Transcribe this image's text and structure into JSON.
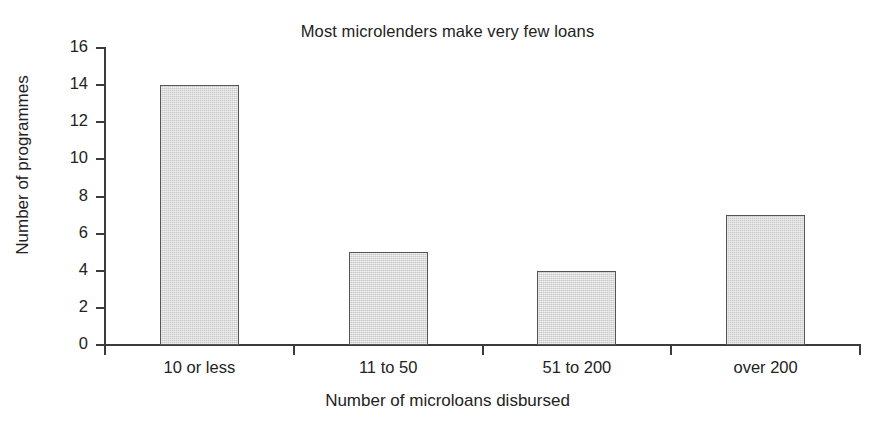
{
  "chart_data": {
    "type": "bar",
    "title": "Most microlenders make very few loans",
    "xlabel": "Number of microloans disbursed",
    "ylabel": "Number of programmes",
    "categories": [
      "10 or less",
      "11 to 50",
      "51 to 200",
      "over 200"
    ],
    "values": [
      14,
      5,
      4,
      7
    ],
    "ylim": [
      0,
      16
    ],
    "ytick_labels": [
      "0",
      "2",
      "4",
      "6",
      "8",
      "10",
      "12",
      "14",
      "16"
    ],
    "ytick_values": [
      0,
      2,
      4,
      6,
      8,
      10,
      12,
      14,
      16
    ],
    "grid": false,
    "legend": "none",
    "series": [
      {
        "name": "Number of programmes",
        "values": [
          14,
          5,
          4,
          7
        ]
      }
    ],
    "colors": {
      "bar_fill": "#c9c9c9",
      "bar_border": "#555555",
      "axis": "#3b3b3b",
      "text": "#222222",
      "background": "#ffffff"
    }
  }
}
